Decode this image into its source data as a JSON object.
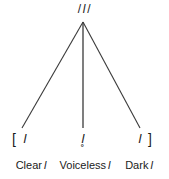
{
  "diagram": {
    "type": "allophone-tree",
    "root": {
      "open_delimiter": "/",
      "segment": "l",
      "close_delimiter": "/",
      "full": "/l/"
    },
    "bracket_open": "[",
    "bracket_close": "]",
    "allophones": [
      {
        "symbol": "l",
        "caption_text": "Clear",
        "caption_segment": "l",
        "caption_full": "Clear l"
      },
      {
        "symbol": "l̥",
        "caption_text": "Voiceless",
        "caption_segment": "l",
        "caption_full": "Voiceless l"
      },
      {
        "symbol": "ɫ",
        "caption_text": "Dark",
        "caption_segment": "l",
        "caption_full": "Dark l"
      }
    ],
    "colors": {
      "background": "#ffffff",
      "line": "#3a3a3a",
      "text": "#1b1b1b"
    },
    "geometry": {
      "apex_x": 83,
      "apex_y": 22,
      "branch_end_y": 128,
      "branch_end_x": [
        22,
        83,
        140
      ]
    }
  }
}
